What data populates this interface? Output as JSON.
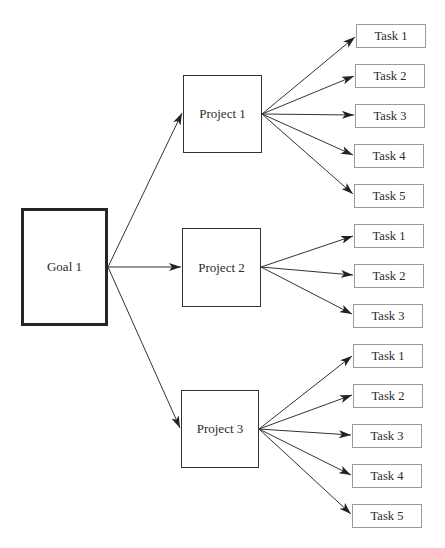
{
  "diagram": {
    "type": "tree",
    "direction": "left-to-right",
    "goal": {
      "id": "goal-1",
      "label": "Goal 1",
      "box": {
        "x": 21,
        "y": 208,
        "w": 87,
        "h": 118
      }
    },
    "projects": [
      {
        "id": "project-1",
        "label": "Project 1",
        "box": {
          "x": 183,
          "y": 75,
          "w": 79,
          "h": 78
        },
        "tasks": [
          {
            "label": "Task 1",
            "box": {
              "x": 356,
              "y": 24,
              "w": 70,
              "h": 24
            }
          },
          {
            "label": "Task 2",
            "box": {
              "x": 355,
              "y": 64,
              "w": 70,
              "h": 24
            }
          },
          {
            "label": "Task 3",
            "box": {
              "x": 355,
              "y": 104,
              "w": 70,
              "h": 24
            }
          },
          {
            "label": "Task 4",
            "box": {
              "x": 354,
              "y": 144,
              "w": 70,
              "h": 24
            }
          },
          {
            "label": "Task 5",
            "box": {
              "x": 354,
              "y": 184,
              "w": 70,
              "h": 24
            }
          }
        ]
      },
      {
        "id": "project-2",
        "label": "Project 2",
        "box": {
          "x": 182,
          "y": 228,
          "w": 79,
          "h": 79
        },
        "tasks": [
          {
            "label": "Task 1",
            "box": {
              "x": 354,
              "y": 224,
              "w": 70,
              "h": 24
            }
          },
          {
            "label": "Task 2",
            "box": {
              "x": 354,
              "y": 264,
              "w": 70,
              "h": 24
            }
          },
          {
            "label": "Task 3",
            "box": {
              "x": 353,
              "y": 304,
              "w": 70,
              "h": 24
            }
          }
        ]
      },
      {
        "id": "project-3",
        "label": "Project 3",
        "box": {
          "x": 181,
          "y": 390,
          "w": 78,
          "h": 78
        },
        "tasks": [
          {
            "label": "Task 1",
            "box": {
              "x": 353,
              "y": 344,
              "w": 70,
              "h": 24
            }
          },
          {
            "label": "Task 2",
            "box": {
              "x": 353,
              "y": 384,
              "w": 70,
              "h": 24
            }
          },
          {
            "label": "Task 3",
            "box": {
              "x": 352,
              "y": 424,
              "w": 70,
              "h": 24
            }
          },
          {
            "label": "Task 4",
            "box": {
              "x": 352,
              "y": 464,
              "w": 70,
              "h": 24
            }
          },
          {
            "label": "Task 5",
            "box": {
              "x": 352,
              "y": 504,
              "w": 70,
              "h": 24
            }
          }
        ]
      }
    ],
    "edges": [
      {
        "from": "Goal 1",
        "to": "Project 1",
        "x1": 108,
        "y1": 267,
        "x2": 182,
        "y2": 113
      },
      {
        "from": "Goal 1",
        "to": "Project 2",
        "x1": 108,
        "y1": 267,
        "x2": 181,
        "y2": 267
      },
      {
        "from": "Goal 1",
        "to": "Project 3",
        "x1": 108,
        "y1": 267,
        "x2": 180,
        "y2": 428
      },
      {
        "from": "Project 1",
        "to": "Task 1",
        "x1": 262,
        "y1": 114,
        "x2": 355,
        "y2": 37
      },
      {
        "from": "Project 1",
        "to": "Task 2",
        "x1": 262,
        "y1": 114,
        "x2": 354,
        "y2": 76
      },
      {
        "from": "Project 1",
        "to": "Task 3",
        "x1": 262,
        "y1": 114,
        "x2": 354,
        "y2": 115
      },
      {
        "from": "Project 1",
        "to": "Task 4",
        "x1": 262,
        "y1": 114,
        "x2": 353,
        "y2": 155
      },
      {
        "from": "Project 1",
        "to": "Task 5",
        "x1": 262,
        "y1": 114,
        "x2": 353,
        "y2": 194
      },
      {
        "from": "Project 2",
        "to": "Task 1",
        "x1": 261,
        "y1": 267,
        "x2": 353,
        "y2": 236
      },
      {
        "from": "Project 2",
        "to": "Task 2",
        "x1": 261,
        "y1": 267,
        "x2": 353,
        "y2": 275
      },
      {
        "from": "Project 2",
        "to": "Task 3",
        "x1": 261,
        "y1": 267,
        "x2": 352,
        "y2": 314
      },
      {
        "from": "Project 3",
        "to": "Task 1",
        "x1": 259,
        "y1": 429,
        "x2": 352,
        "y2": 356
      },
      {
        "from": "Project 3",
        "to": "Task 2",
        "x1": 259,
        "y1": 429,
        "x2": 352,
        "y2": 395
      },
      {
        "from": "Project 3",
        "to": "Task 3",
        "x1": 259,
        "y1": 429,
        "x2": 351,
        "y2": 435
      },
      {
        "from": "Project 3",
        "to": "Task 4",
        "x1": 259,
        "y1": 429,
        "x2": 351,
        "y2": 475
      },
      {
        "from": "Project 3",
        "to": "Task 5",
        "x1": 259,
        "y1": 429,
        "x2": 351,
        "y2": 514
      }
    ],
    "colors": {
      "background": "#ffffff",
      "goal_border": "#262626",
      "project_border": "#333333",
      "task_border": "#9a9a9a",
      "edge": "#333333",
      "text": "#2a2a2a"
    }
  }
}
